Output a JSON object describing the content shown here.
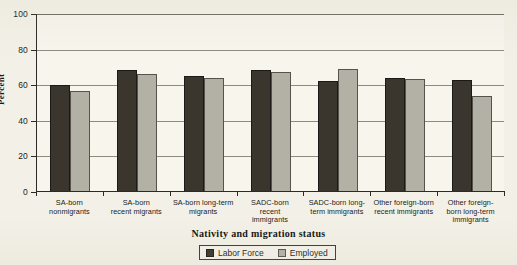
{
  "chart_data": {
    "type": "bar",
    "title": "",
    "xlabel": "Nativity and  migration status",
    "ylabel": "Percent",
    "ylim": [
      0,
      100
    ],
    "yticks": [
      0,
      20,
      40,
      60,
      80,
      100
    ],
    "grid": true,
    "legend_position": "bottom-center",
    "categories": [
      "SA-born nonmigrants",
      "SA-born recent migrants",
      "SA-born long-term migrants",
      "SADC-born recent immigrants",
      "SADC-born long-term immigrants",
      "Other foreign-born recent immigrants",
      "Other foreign-born long-term immigrants"
    ],
    "category_lines": [
      [
        "SA-born",
        "nonmigrants"
      ],
      [
        "SA-born",
        "recent migrants"
      ],
      [
        "SA-born long-term",
        "migrants"
      ],
      [
        "SADC-born",
        "recent",
        "immigrants"
      ],
      [
        "SADC-born long-",
        "term immigrants"
      ],
      [
        "Other foreign-born",
        "recent immigrants"
      ],
      [
        "Other foreign-",
        "born long-term",
        "immigrants"
      ]
    ],
    "series": [
      {
        "name": "Labor Force",
        "color": "#3a352d",
        "values": [
          60.3,
          68.5,
          65.2,
          68.3,
          62.2,
          64.2,
          63.0
        ]
      },
      {
        "name": "Employed",
        "color": "#b3b0a6",
        "values": [
          56.8,
          66.3,
          63.8,
          67.2,
          69.2,
          63.6,
          53.9
        ]
      }
    ]
  },
  "legend": {
    "items": [
      {
        "label": "Labor Force"
      },
      {
        "label": "Employed"
      }
    ]
  }
}
